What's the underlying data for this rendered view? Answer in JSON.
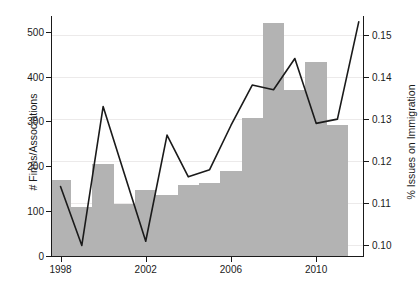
{
  "chart_data": {
    "type": "bar",
    "title": "",
    "subtitle": "",
    "xlabel": "",
    "ylabel": "# Firms/Associations",
    "ylabel_right": "% Issues on Immigration",
    "grid": true,
    "legend_position": "none",
    "x": [
      1998,
      1999,
      2000,
      2001,
      2002,
      2003,
      2004,
      2005,
      2006,
      2007,
      2008,
      2009,
      2010,
      2011
    ],
    "xlim": [
      1997.6,
      2012.2
    ],
    "xticks": [
      1998,
      2002,
      2006,
      2010
    ],
    "xtick_labels": [
      "1998",
      "2002",
      "2006",
      "2010"
    ],
    "ylim": [
      0,
      535
    ],
    "yticks": [
      0,
      100,
      200,
      300,
      400,
      500
    ],
    "ytick_labels": [
      "0",
      "100",
      "200",
      "300",
      "400",
      "500"
    ],
    "ylim_right": [
      0.0975,
      0.1545
    ],
    "yticks_right": [
      0.1,
      0.11,
      0.12,
      0.13,
      0.14,
      0.15
    ],
    "ytick_labels_right": [
      "0.10",
      "0.11",
      "0.12",
      "0.13",
      "0.14",
      "0.15"
    ],
    "series": [
      {
        "name": "# Firms/Associations",
        "kind": "bar",
        "axis": "left",
        "color": "#b3b3b3",
        "categories": [
          1998,
          1999,
          2000,
          2001,
          2002,
          2003,
          2004,
          2005,
          2006,
          2007,
          2008,
          2009,
          2010,
          2011
        ],
        "values": [
          170,
          110,
          205,
          115,
          148,
          137,
          158,
          162,
          190,
          307,
          520,
          370,
          432,
          293
        ]
      },
      {
        "name": "% Issues on Immigration",
        "kind": "line",
        "axis": "right",
        "color": "#1a1a1a",
        "x": [
          1998,
          1999,
          2000,
          2001,
          2002,
          2003,
          2004,
          2005,
          2006,
          2007,
          2008,
          2009,
          2010,
          2011,
          2012
        ],
        "values": [
          0.114,
          0.1,
          0.133,
          0.117,
          0.101,
          0.1262,
          0.1163,
          0.118,
          0.1285,
          0.1381,
          0.137,
          0.1444,
          0.129,
          0.13,
          0.1531
        ]
      }
    ]
  }
}
